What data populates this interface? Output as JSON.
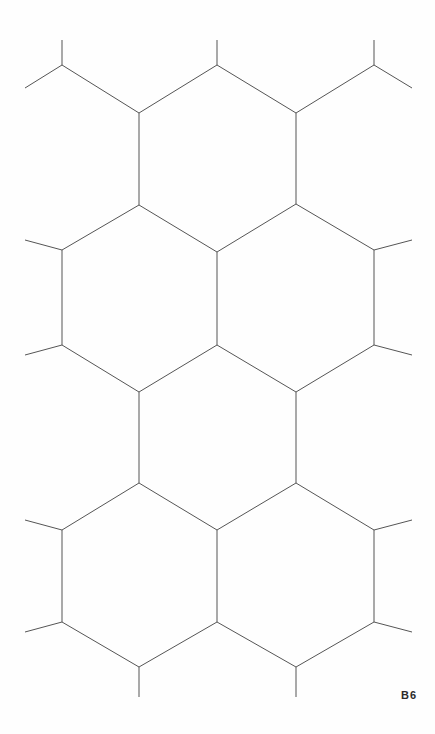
{
  "sheet": {
    "width": 435,
    "height": 734,
    "background_color": "#fefefe",
    "label": "B6",
    "label_color": "#2b2b2b"
  },
  "figure": {
    "kind": "hexagonal-tessellation",
    "line_color": "#555555",
    "line_width": 1,
    "hex_orientation": "pointy-top",
    "column_x": [
      62,
      139,
      217,
      296,
      374
    ],
    "horizontal_pitch": 78,
    "vertical_edge_length": 93,
    "apex_rise": 47,
    "row_pitch": 140
  },
  "chart_data": {
    "type": "line",
    "title": "B6",
    "xlabel": "",
    "ylabel": "",
    "xlim": [
      0,
      435
    ],
    "ylim": [
      734,
      0
    ],
    "grid": false,
    "legend": null,
    "stroke": "#555555",
    "stroke_width": 1,
    "vertices": [
      {
        "id": "a0",
        "x": 62,
        "y": 65
      },
      {
        "id": "b0",
        "x": 139,
        "y": 113
      },
      {
        "id": "c0",
        "x": 217,
        "y": 65
      },
      {
        "id": "d0",
        "x": 296,
        "y": 113
      },
      {
        "id": "e0",
        "x": 374,
        "y": 65
      },
      {
        "id": "a1",
        "x": 62,
        "y": 250
      },
      {
        "id": "b1",
        "x": 139,
        "y": 205
      },
      {
        "id": "c1",
        "x": 217,
        "y": 252
      },
      {
        "id": "d1",
        "x": 296,
        "y": 204
      },
      {
        "id": "e1",
        "x": 374,
        "y": 250
      },
      {
        "id": "a2",
        "x": 62,
        "y": 345
      },
      {
        "id": "b2",
        "x": 139,
        "y": 392
      },
      {
        "id": "c2",
        "x": 217,
        "y": 345
      },
      {
        "id": "d2",
        "x": 296,
        "y": 392
      },
      {
        "id": "e2",
        "x": 374,
        "y": 345
      },
      {
        "id": "a3",
        "x": 62,
        "y": 530
      },
      {
        "id": "b3",
        "x": 139,
        "y": 483
      },
      {
        "id": "c3",
        "x": 217,
        "y": 530
      },
      {
        "id": "d3",
        "x": 296,
        "y": 483
      },
      {
        "id": "e3",
        "x": 374,
        "y": 530
      },
      {
        "id": "a4",
        "x": 62,
        "y": 622
      },
      {
        "id": "b4",
        "x": 139,
        "y": 667
      },
      {
        "id": "c4",
        "x": 217,
        "y": 622
      },
      {
        "id": "d4",
        "x": 296,
        "y": 667
      },
      {
        "id": "e4",
        "x": 374,
        "y": 622
      }
    ],
    "segments": [
      [
        62,
        40,
        62,
        65
      ],
      [
        62,
        65,
        25,
        88
      ],
      [
        62,
        65,
        139,
        113
      ],
      [
        139,
        113,
        217,
        65
      ],
      [
        217,
        40,
        217,
        65
      ],
      [
        217,
        65,
        296,
        113
      ],
      [
        296,
        113,
        374,
        65
      ],
      [
        374,
        40,
        374,
        65
      ],
      [
        374,
        65,
        412,
        88
      ],
      [
        139,
        113,
        139,
        205
      ],
      [
        296,
        113,
        296,
        204
      ],
      [
        25,
        240,
        62,
        250
      ],
      [
        62,
        250,
        139,
        205
      ],
      [
        139,
        205,
        217,
        252
      ],
      [
        217,
        252,
        296,
        204
      ],
      [
        296,
        204,
        374,
        250
      ],
      [
        374,
        250,
        412,
        240
      ],
      [
        62,
        250,
        62,
        345
      ],
      [
        217,
        252,
        217,
        345
      ],
      [
        374,
        250,
        374,
        345
      ],
      [
        25,
        355,
        62,
        345
      ],
      [
        62,
        345,
        139,
        392
      ],
      [
        139,
        392,
        217,
        345
      ],
      [
        217,
        345,
        296,
        392
      ],
      [
        296,
        392,
        374,
        345
      ],
      [
        374,
        345,
        412,
        355
      ],
      [
        139,
        392,
        139,
        483
      ],
      [
        296,
        392,
        296,
        483
      ],
      [
        25,
        520,
        62,
        530
      ],
      [
        62,
        530,
        139,
        483
      ],
      [
        139,
        483,
        217,
        530
      ],
      [
        217,
        530,
        296,
        483
      ],
      [
        296,
        483,
        374,
        530
      ],
      [
        374,
        530,
        412,
        520
      ],
      [
        62,
        530,
        62,
        622
      ],
      [
        217,
        530,
        217,
        622
      ],
      [
        374,
        530,
        374,
        622
      ],
      [
        25,
        632,
        62,
        622
      ],
      [
        62,
        622,
        139,
        667
      ],
      [
        139,
        667,
        217,
        622
      ],
      [
        217,
        622,
        296,
        667
      ],
      [
        296,
        667,
        374,
        622
      ],
      [
        374,
        622,
        412,
        632
      ],
      [
        139,
        667,
        139,
        697
      ],
      [
        296,
        667,
        296,
        697
      ]
    ]
  }
}
